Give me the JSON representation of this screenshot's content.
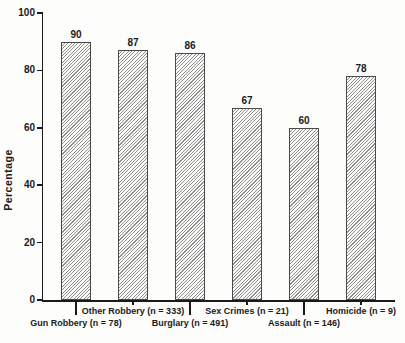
{
  "chart_data": {
    "type": "bar",
    "title": "",
    "ylabel": "Percentage",
    "xlabel": "",
    "ylim": [
      0,
      100
    ],
    "yticks": [
      0,
      20,
      40,
      60,
      80,
      100
    ],
    "grid": false,
    "legend_position": "none",
    "bar_style": "diagonal-hatch",
    "category_label_layout": "staggered-two-rows",
    "categories": [
      "Gun Robbery (n = 78)",
      "Other Robbery (n = 333)",
      "Burglary (n = 491)",
      "Sex Crimes (n = 21)",
      "Assault (n = 146)",
      "Homicide (n = 9)"
    ],
    "values": [
      90,
      87,
      86,
      67,
      60,
      78
    ],
    "value_labels": [
      "90",
      "87",
      "86",
      "67",
      "60",
      "78"
    ]
  },
  "colors": {
    "background": "#fdfdfc",
    "axis": "#1a1a1a",
    "text": "#1a1a1a",
    "hatch_line": "#8f8f8f",
    "bar_border": "#4a4a4a"
  }
}
